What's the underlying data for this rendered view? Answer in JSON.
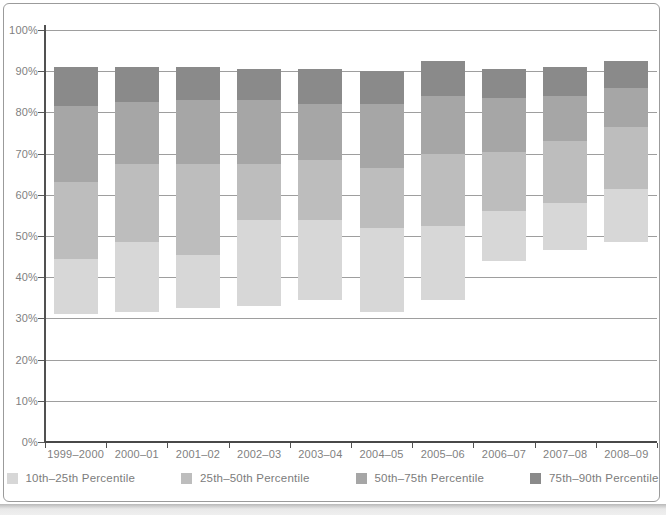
{
  "colors": {
    "background": "#ffffff",
    "frame_border": "#9b9b9b",
    "gridline": "#9e9e9e",
    "axis": "#4f4f4f",
    "label_text": "#7f7f7f"
  },
  "chart_data": {
    "type": "bar",
    "subtype": "floating_stacked_percentile_bands",
    "title": "",
    "xlabel": "",
    "ylabel": "",
    "grid": true,
    "legend_position": "bottom",
    "categories": [
      "1999–2000",
      "2000–01",
      "2001–02",
      "2002–03",
      "2003–04",
      "2004–05",
      "2005–06",
      "2006–07",
      "2007–08",
      "2008–09"
    ],
    "y_axis": {
      "min": 0,
      "max": 100,
      "step": 10,
      "tick_labels": [
        "0%",
        "10%",
        "20%",
        "30%",
        "40%",
        "50%",
        "60%",
        "70%",
        "80%",
        "90%",
        "100%"
      ]
    },
    "series": [
      {
        "name": "10th–25th Percentile",
        "color": "#d7d7d7",
        "lower": [
          31,
          31.5,
          32.5,
          33,
          34.5,
          31.5,
          34.5,
          44,
          46.5,
          48.5
        ],
        "upper": [
          44.5,
          48.5,
          45.5,
          54,
          54,
          52,
          52.5,
          56,
          58,
          61.5
        ]
      },
      {
        "name": "25th–50th Percentile",
        "color": "#bdbdbd",
        "lower": [
          44.5,
          48.5,
          45.5,
          54,
          54,
          52,
          52.5,
          56,
          58,
          61.5
        ],
        "upper": [
          63,
          67.5,
          67.5,
          67.5,
          68.5,
          66.5,
          70,
          70.5,
          73,
          76.5
        ]
      },
      {
        "name": "50th–75th Percentile",
        "color": "#a6a6a6",
        "lower": [
          63,
          67.5,
          67.5,
          67.5,
          68.5,
          66.5,
          70,
          70.5,
          73,
          76.5
        ],
        "upper": [
          81.5,
          82.5,
          83,
          83,
          82,
          82,
          84,
          83.5,
          84,
          86
        ]
      },
      {
        "name": "75th–90th Percentile",
        "color": "#8a8a8a",
        "lower": [
          81.5,
          82.5,
          83,
          83,
          82,
          82,
          84,
          83.5,
          84,
          86
        ],
        "upper": [
          91,
          91,
          91,
          90.5,
          90.5,
          90,
          92.5,
          90.5,
          91,
          92.5
        ]
      }
    ]
  }
}
